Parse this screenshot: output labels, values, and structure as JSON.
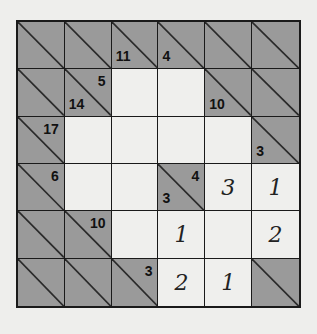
{
  "puzzle": {
    "type": "kakuro",
    "rows": 6,
    "cols": 6,
    "colors": {
      "block": "#9a9a9a",
      "white": "#efefed",
      "line": "#1a1a1a",
      "background": "#eeeeec"
    },
    "cells": [
      [
        {
          "kind": "block"
        },
        {
          "kind": "block"
        },
        {
          "kind": "block",
          "down": "11"
        },
        {
          "kind": "block",
          "down": "4"
        },
        {
          "kind": "block"
        },
        {
          "kind": "block"
        }
      ],
      [
        {
          "kind": "block"
        },
        {
          "kind": "block",
          "right": "5",
          "down": "14"
        },
        {
          "kind": "white",
          "value": ""
        },
        {
          "kind": "white",
          "value": ""
        },
        {
          "kind": "block",
          "down": "10"
        },
        {
          "kind": "block"
        }
      ],
      [
        {
          "kind": "block",
          "right": "17"
        },
        {
          "kind": "white",
          "value": ""
        },
        {
          "kind": "white",
          "value": ""
        },
        {
          "kind": "white",
          "value": ""
        },
        {
          "kind": "white",
          "value": ""
        },
        {
          "kind": "block",
          "down": "3"
        }
      ],
      [
        {
          "kind": "block",
          "right": "6"
        },
        {
          "kind": "white",
          "value": ""
        },
        {
          "kind": "white",
          "value": ""
        },
        {
          "kind": "block",
          "right": "4",
          "down": "3"
        },
        {
          "kind": "white",
          "value": "3"
        },
        {
          "kind": "white",
          "value": "1"
        }
      ],
      [
        {
          "kind": "block"
        },
        {
          "kind": "block",
          "right": "10"
        },
        {
          "kind": "white",
          "value": ""
        },
        {
          "kind": "white",
          "value": "1"
        },
        {
          "kind": "white",
          "value": ""
        },
        {
          "kind": "white",
          "value": "2"
        }
      ],
      [
        {
          "kind": "block"
        },
        {
          "kind": "block"
        },
        {
          "kind": "block",
          "right": "3"
        },
        {
          "kind": "white",
          "value": "2"
        },
        {
          "kind": "white",
          "value": "1"
        },
        {
          "kind": "block"
        }
      ]
    ]
  }
}
